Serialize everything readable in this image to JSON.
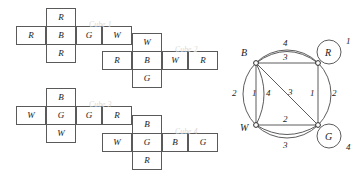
{
  "figure": {
    "panels": [
      "cube-nets",
      "multigraph"
    ]
  },
  "cubes": [
    {
      "label": "Cube 1",
      "top": "R",
      "bottom": "R",
      "row": [
        "R",
        "B",
        "G",
        "W"
      ]
    },
    {
      "label": "Cube 2",
      "top": "W",
      "bottom": "G",
      "row": [
        "R",
        "B",
        "W",
        "R"
      ]
    },
    {
      "label": "Cube 3",
      "top": "B",
      "bottom": "W",
      "row": [
        "W",
        "G",
        "G",
        "R"
      ]
    },
    {
      "label": "Cube 4",
      "top": "B",
      "bottom": "R",
      "row": [
        "W",
        "G",
        "B",
        "G"
      ]
    }
  ],
  "graph": {
    "vertices": [
      {
        "id": "B",
        "label": "B"
      },
      {
        "id": "R",
        "label": "R"
      },
      {
        "id": "W",
        "label": "W"
      },
      {
        "id": "G",
        "label": "G"
      }
    ],
    "edge_labels": {
      "b_r_outer": "4",
      "b_r_inner": "3",
      "b_w_outer": "2",
      "b_w_straight": "1",
      "b_w_inner": "4",
      "b_g_diagonal": "3",
      "r_g_straight": "1",
      "r_g_outer": "2",
      "w_g_straight": "2",
      "w_g_outer": "3",
      "r_loop": "1",
      "g_loop": "4"
    },
    "edges": [
      {
        "from": "B",
        "to": "R",
        "label": "4",
        "style": "outer-arc"
      },
      {
        "from": "B",
        "to": "R",
        "label": "3",
        "style": "straight"
      },
      {
        "from": "B",
        "to": "W",
        "label": "2",
        "style": "outer-arc"
      },
      {
        "from": "B",
        "to": "W",
        "label": "1",
        "style": "straight"
      },
      {
        "from": "B",
        "to": "W",
        "label": "4",
        "style": "inner-arc"
      },
      {
        "from": "B",
        "to": "G",
        "label": "3",
        "style": "diagonal"
      },
      {
        "from": "R",
        "to": "G",
        "label": "1",
        "style": "straight"
      },
      {
        "from": "R",
        "to": "G",
        "label": "2",
        "style": "outer-arc"
      },
      {
        "from": "W",
        "to": "G",
        "label": "2",
        "style": "straight"
      },
      {
        "from": "W",
        "to": "G",
        "label": "3",
        "style": "outer-arc"
      },
      {
        "from": "R",
        "to": "R",
        "label": "1",
        "style": "self-loop"
      },
      {
        "from": "G",
        "to": "G",
        "label": "4",
        "style": "self-loop"
      }
    ]
  },
  "colors": {
    "stroke": "#5a5a5a",
    "text": "#1a1a1a",
    "faint_label": "#d8d8d8"
  }
}
